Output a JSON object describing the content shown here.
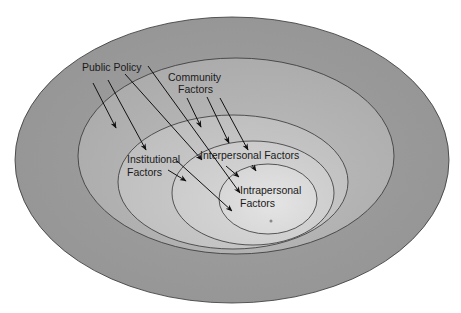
{
  "diagram": {
    "type": "nested-ellipses",
    "levels": [
      {
        "id": "public-policy",
        "label": "Public Policy",
        "lines": [
          "Public Policy"
        ],
        "color": "#9a9a9a"
      },
      {
        "id": "community",
        "label": "Community Factors",
        "lines": [
          "Community",
          "Factors"
        ],
        "color": "#b3b3b3"
      },
      {
        "id": "institutional",
        "label": "Institutional Factors",
        "lines": [
          "Institutional",
          "Factors"
        ],
        "color": "#c6c6c6"
      },
      {
        "id": "interpersonal",
        "label": "Interpersonal Factors",
        "lines": [
          "Interpersonal Factors"
        ],
        "color": "#d2d2d2"
      },
      {
        "id": "intrapersonal",
        "label": "Intrapersonal Factors",
        "lines": [
          "Intrapersonal",
          "Factors"
        ],
        "color": "#dedede"
      }
    ],
    "colors": {
      "background": "#ffffff",
      "stroke": "#333333",
      "arrow": "#111111",
      "text": "#1a1a1a"
    }
  }
}
